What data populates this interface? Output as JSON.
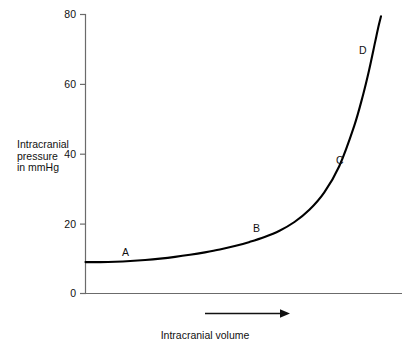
{
  "chart_data": {
    "type": "line",
    "title": "",
    "subtitle": "",
    "xlabel": "Intracranial volume",
    "ylabel": "Intracranial pressure in mmHg",
    "ylabel_lines": [
      "Intracranial",
      "pressure",
      "in mmHg"
    ],
    "xlim": [
      0,
      100
    ],
    "ylim": [
      0,
      80
    ],
    "grid": false,
    "legend": "none",
    "y_ticks": [
      0,
      20,
      40,
      60,
      80
    ],
    "y_tick_labels": [
      "0",
      "20",
      "40",
      "60",
      "80"
    ],
    "x_ticks": [],
    "x_tick_labels": [],
    "x_axis_arrow": true,
    "series": [
      {
        "name": "Intracranial pressure-volume curve",
        "x": [
          0,
          5,
          10,
          15,
          20,
          25,
          30,
          35,
          40,
          45,
          50,
          55,
          60,
          65,
          70,
          75,
          80,
          85,
          90,
          93,
          95,
          97,
          98,
          99
        ],
        "y": [
          9.0,
          9.0,
          9.1,
          9.3,
          9.6,
          10.0,
          10.5,
          11.1,
          11.8,
          12.6,
          13.6,
          14.8,
          16.2,
          18.0,
          20.5,
          24.0,
          29.0,
          36.5,
          48.0,
          57.0,
          64.0,
          72.0,
          76.0,
          79.5
        ]
      }
    ],
    "annotations": [
      {
        "label": "A",
        "x": 13,
        "y": 13.5
      },
      {
        "label": "B",
        "x": 55,
        "y": 19.0
      },
      {
        "label": "C",
        "x": 83,
        "y": 38.5
      },
      {
        "label": "D",
        "x": 91,
        "y": 71.0
      }
    ],
    "colors": {
      "curve": "#000000",
      "axis": "#6b6b6b",
      "text": "#111111",
      "background": "#ffffff"
    }
  }
}
